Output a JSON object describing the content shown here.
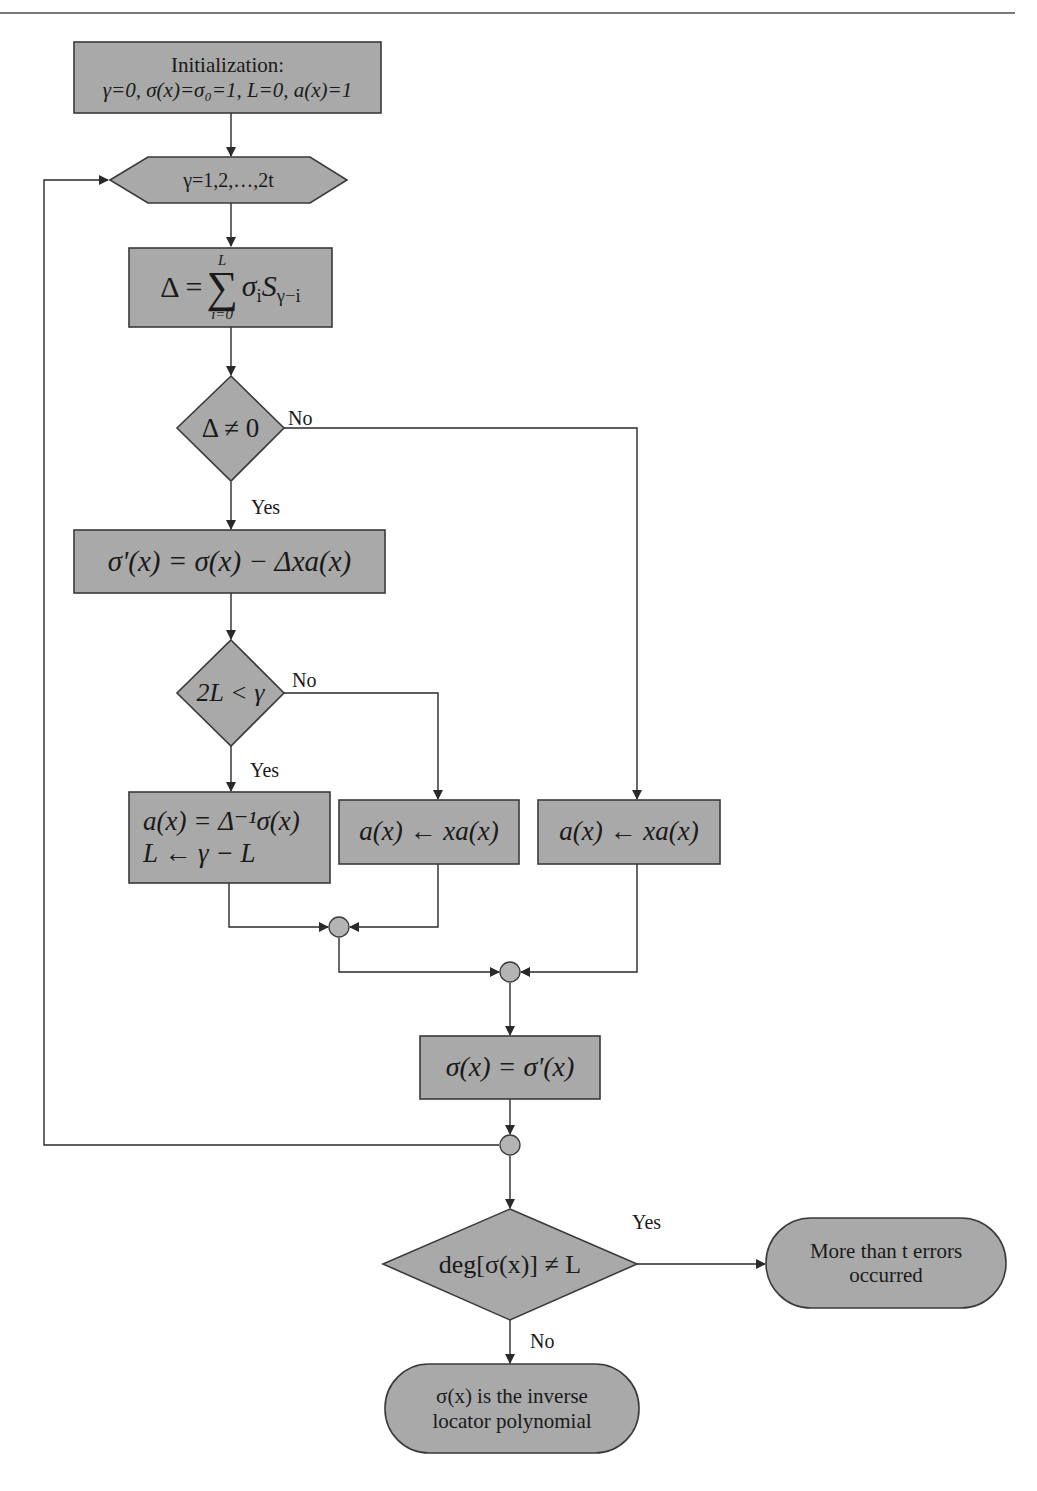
{
  "figure": {
    "colors": {
      "node_fill": "#a9a9a9",
      "node_stroke": "#3a3a3a",
      "line": "#2a2a2a",
      "junction_fill": "#b4b4b4",
      "background": "#ffffff"
    }
  },
  "nodes": {
    "init": {
      "line1": "Initialization:",
      "line2": "γ=0, σ(x)=σ₀=1, L=0, a(x)=1"
    },
    "loop": {
      "label": "γ=1,2,…,2t"
    },
    "discrepancy": {
      "label": "Δ = Σ_{i=0}^{L} σ_i S_{γ−i}",
      "lhs": "Δ =",
      "upper": "L",
      "lower": "i=0",
      "body": "σ",
      "body_sub": "i",
      "term": "S",
      "term_sub": "γ−i"
    },
    "check_delta": {
      "label": "Δ ≠ 0"
    },
    "update_sigma": {
      "label": "σ'(x) = σ(x) − Δxa(x)"
    },
    "check_length": {
      "label": "2L < γ"
    },
    "update_a_reset": {
      "line1": "a(x) = Δ⁻¹σ(x)",
      "line2": "L ← γ − L"
    },
    "shift_a_1": {
      "label": "a(x) ← xa(x)"
    },
    "shift_a_2": {
      "label": "a(x) ← xa(x)"
    },
    "commit_sigma": {
      "label": "σ(x) = σ'(x)"
    },
    "check_degree": {
      "label": "deg[σ(x)] ≠ L"
    },
    "fail": {
      "line1": "More than t errors",
      "line2": "occurred"
    },
    "success": {
      "line1": "σ(x) is the inverse",
      "line2": "locator polynomial"
    }
  },
  "edges": {
    "check_delta_no": "No",
    "check_delta_yes": "Yes",
    "check_length_no": "No",
    "check_length_yes": "Yes",
    "check_degree_yes": "Yes",
    "check_degree_no": "No"
  }
}
